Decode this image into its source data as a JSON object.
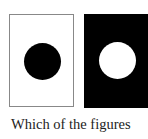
{
  "figures": [
    {
      "name": "white-background-black-circle",
      "background": "#ffffff",
      "circle": "#000000"
    },
    {
      "name": "black-background-white-circle",
      "background": "#000000",
      "circle": "#ffffff"
    }
  ],
  "caption": "Which of the figures"
}
